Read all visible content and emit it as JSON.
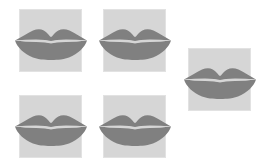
{
  "canvas": {
    "width": 275,
    "height": 162,
    "background_color": "#ffffff"
  },
  "palette": {
    "page_background": "#ffffff",
    "tile_background": "#d6d6d6",
    "tile_border": "#e2e2e2",
    "glyph_fill": "#808080",
    "glyph_highlight": "#d6d6d6"
  },
  "icon": {
    "name": "lips-icon",
    "label": "Lips",
    "fill_color": "#808080",
    "gap_color": "#d6d6d6"
  },
  "tiles": [
    {
      "id": "tile-1",
      "name": "lips-tile-top-left",
      "x": 19,
      "y": 9,
      "width": 63,
      "height": 63,
      "icon": "lips-icon"
    },
    {
      "id": "tile-2",
      "name": "lips-tile-top-center",
      "x": 103,
      "y": 9,
      "width": 63,
      "height": 63,
      "icon": "lips-icon"
    },
    {
      "id": "tile-3",
      "name": "lips-tile-right",
      "x": 188,
      "y": 48,
      "width": 63,
      "height": 63,
      "icon": "lips-icon"
    },
    {
      "id": "tile-4",
      "name": "lips-tile-bottom-left",
      "x": 19,
      "y": 95,
      "width": 63,
      "height": 63,
      "icon": "lips-icon"
    },
    {
      "id": "tile-5",
      "name": "lips-tile-bottom-center",
      "x": 103,
      "y": 95,
      "width": 63,
      "height": 63,
      "icon": "lips-icon"
    }
  ]
}
